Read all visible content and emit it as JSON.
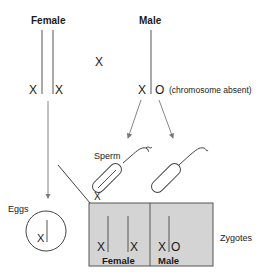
{
  "parents": {
    "female": {
      "label": "Female",
      "chromosomes": [
        "X",
        "X"
      ]
    },
    "middle_x": "X",
    "male": {
      "label": "Male",
      "chromosomes": [
        "X",
        "O"
      ],
      "note": "(chromosome absent)"
    }
  },
  "gametes": {
    "sperm_label": "Sperm",
    "sperm_x_label": "X",
    "eggs_label": "Eggs",
    "egg_chromosome": "X"
  },
  "zygotes": {
    "label": "Zygotes",
    "female": {
      "label": "Female",
      "chromosomes": [
        "X",
        "X"
      ]
    },
    "male": {
      "label": "Male",
      "chromosomes": [
        "X",
        "O"
      ]
    },
    "box_fill": "#d4d4d4",
    "border": "#555555"
  }
}
